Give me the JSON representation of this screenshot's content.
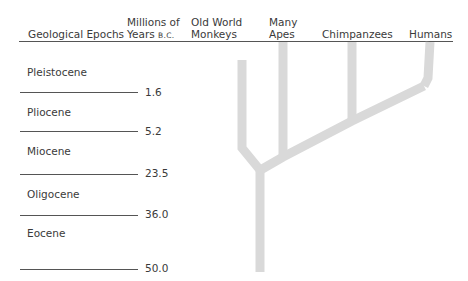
{
  "header": {
    "col_epochs": "Geological Epochs",
    "col_years_line1": "Millions of",
    "col_years_line2": "Years",
    "col_years_suffix": "B.C.",
    "col_monkeys_line1": "Old World",
    "col_monkeys_line2": "Monkeys",
    "col_apes_line1": "Many",
    "col_apes_line2": "Apes",
    "col_chimps": "Chimpanzees",
    "col_humans": "Humans"
  },
  "epochs": [
    {
      "name": "Pleistocene",
      "boundary": "1.6"
    },
    {
      "name": "Pliocene",
      "boundary": "5.2"
    },
    {
      "name": "Miocene",
      "boundary": "23.5"
    },
    {
      "name": "Oligocene",
      "boundary": "36.0"
    },
    {
      "name": "Eocene",
      "boundary": "50.0"
    }
  ],
  "tree": {
    "branch_color": "#d9d9d9",
    "lineages": [
      "Old World Monkeys",
      "Many Apes",
      "Chimpanzees",
      "Humans"
    ]
  }
}
